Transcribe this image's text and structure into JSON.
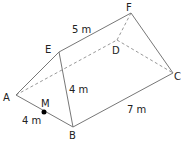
{
  "diagram": {
    "type": "triangular-prism",
    "vertices": {
      "A": {
        "label": "A",
        "x": 16,
        "y": 95
      },
      "B": {
        "label": "B",
        "x": 73,
        "y": 127
      },
      "C": {
        "label": "C",
        "x": 173,
        "y": 73
      },
      "D": {
        "label": "D",
        "x": 117,
        "y": 40
      },
      "E": {
        "label": "E",
        "x": 59,
        "y": 52
      },
      "F": {
        "label": "F",
        "x": 131,
        "y": 13
      },
      "M": {
        "label": "M",
        "x": 44,
        "y": 112
      }
    },
    "measurements": {
      "EF": "5 m",
      "EB": "4 m",
      "AB": "4 m",
      "BC": "7 m"
    },
    "colors": {
      "edge": "#777777",
      "hidden_edge": "#999999",
      "text": "#222222",
      "point": "#000000"
    }
  }
}
